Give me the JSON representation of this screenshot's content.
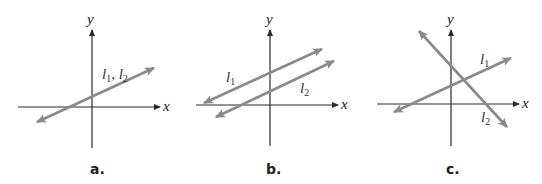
{
  "figure": {
    "panels": [
      {
        "id": "a",
        "caption": "a.",
        "axes": {
          "x_label": "x",
          "y_label": "y"
        },
        "lines": [
          {
            "label": "l1, l2",
            "description": "coincident lines with positive slope"
          }
        ],
        "label_text": {
          "l": "l",
          "sub1": "1",
          "sep": ", ",
          "l2": "l",
          "sub2": "2"
        }
      },
      {
        "id": "b",
        "caption": "b.",
        "axes": {
          "x_label": "x",
          "y_label": "y"
        },
        "lines": [
          {
            "label": "l1",
            "description": "parallel line, higher intercept"
          },
          {
            "label": "l2",
            "description": "parallel line, lower intercept"
          }
        ],
        "label_text": {
          "l1": "l",
          "sub1": "1",
          "l2": "l",
          "sub2": "2"
        }
      },
      {
        "id": "c",
        "caption": "c.",
        "axes": {
          "x_label": "x",
          "y_label": "y"
        },
        "lines": [
          {
            "label": "l1",
            "description": "positive slope line"
          },
          {
            "label": "l2",
            "description": "negative slope line intersecting l1"
          }
        ],
        "label_text": {
          "l1": "l",
          "sub1": "1",
          "l2": "l",
          "sub2": "2"
        }
      }
    ]
  }
}
